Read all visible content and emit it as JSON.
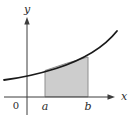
{
  "figure": {
    "labels": {
      "y_axis": "y",
      "x_axis": "x",
      "origin": "0",
      "lower_bound": "a",
      "upper_bound": "b"
    },
    "colors": {
      "curve": "#1a1a1a",
      "axis": "#3d3d3d",
      "region_fill": "#cdcdcd",
      "region_border": "#8f8f8f",
      "label": "#2b2b2b",
      "background": "#ffffff"
    },
    "region": {
      "from": "a",
      "to": "b",
      "bounded_above_by": "curve",
      "bounded_below_by": "x-axis"
    }
  }
}
